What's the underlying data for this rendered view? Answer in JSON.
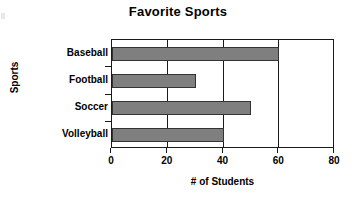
{
  "chart_data": {
    "type": "bar",
    "orientation": "horizontal",
    "title": "Favorite Sports",
    "xlabel": "# of Students",
    "ylabel": "Sports",
    "categories": [
      "Baseball",
      "Football",
      "Soccer",
      "Volleyball"
    ],
    "values": [
      60,
      30,
      50,
      40
    ],
    "xlim": [
      0,
      80
    ],
    "xticks": [
      0,
      20,
      40,
      60,
      80
    ],
    "xtick_labels": [
      "0",
      "20",
      "40",
      "60",
      "80"
    ],
    "grid": true,
    "grid_axis": "x",
    "legend": false,
    "bar_color": "#7f7f7f",
    "bar_edge_color": "#333333",
    "axis_color": "#1a1a1a",
    "background": "#ffffff"
  }
}
